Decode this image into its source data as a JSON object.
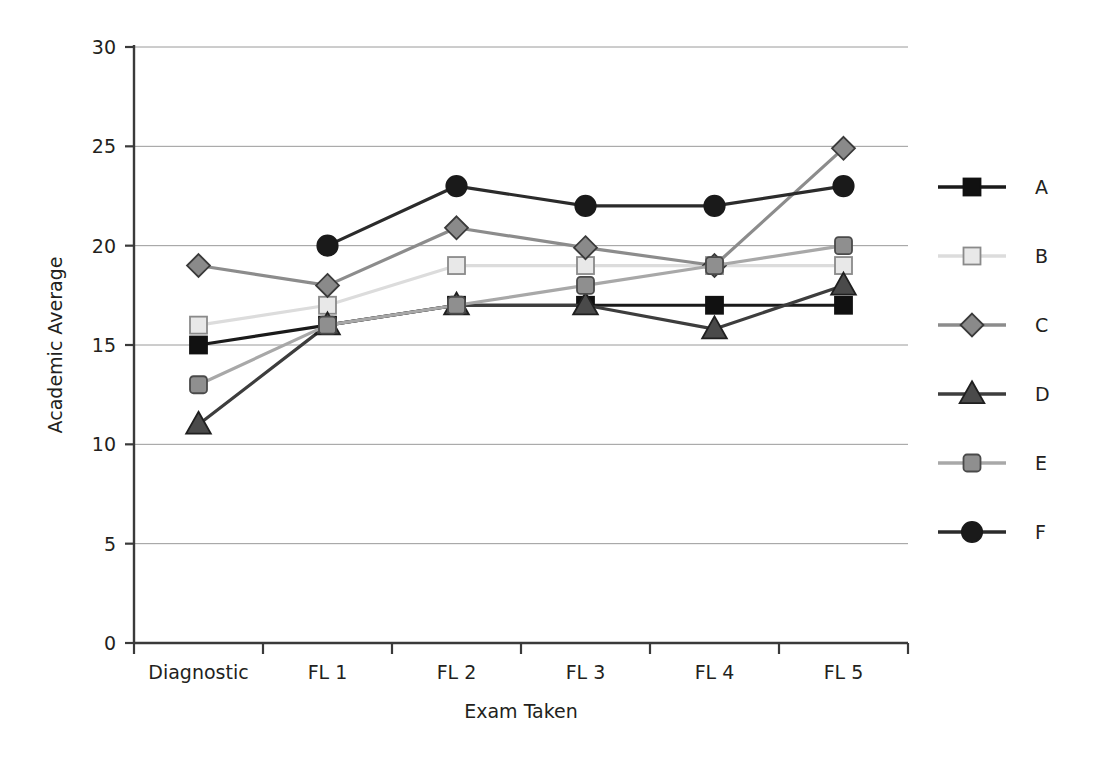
{
  "chart_data": {
    "type": "line",
    "title": "",
    "xlabel": "Exam Taken",
    "ylabel": "Academic Average",
    "categories": [
      "Diagnostic",
      "FL 1",
      "FL 2",
      "FL 3",
      "FL 4",
      "FL 5"
    ],
    "ylim": [
      0,
      30
    ],
    "yticks": [
      0,
      5,
      10,
      15,
      20,
      25,
      30
    ],
    "ytick_labels": [
      "0",
      "5",
      "10",
      "15",
      "20",
      "25",
      "30"
    ],
    "grid": "horizontal",
    "legend_position": "right",
    "series": [
      {
        "name": "A",
        "values": [
          15,
          16,
          17,
          17,
          17,
          17
        ],
        "marker": "square-filled",
        "line_color": "#1a1a1a",
        "marker_fill": "#111111",
        "marker_stroke": "#111111"
      },
      {
        "name": "B",
        "values": [
          16,
          17,
          19,
          19,
          19,
          19
        ],
        "marker": "square-open",
        "line_color": "#dcdcdc",
        "marker_fill": "#e8e8e8",
        "marker_stroke": "#8a8a8a"
      },
      {
        "name": "C",
        "values": [
          19,
          18,
          20.9,
          19.9,
          19,
          24.9
        ],
        "marker": "diamond",
        "line_color": "#8c8c8c",
        "marker_fill": "#8a8a8a",
        "marker_stroke": "#3a3a3a"
      },
      {
        "name": "D",
        "values": [
          11,
          16,
          17,
          17,
          15.8,
          18
        ],
        "marker": "triangle",
        "line_color": "#3d3d3d",
        "marker_fill": "#4a4a4a",
        "marker_stroke": "#1f1f1f"
      },
      {
        "name": "E",
        "values": [
          13,
          16,
          17,
          18,
          19,
          20
        ],
        "marker": "square-rounded",
        "line_color": "#a8a8a8",
        "marker_fill": "#8f8f8f",
        "marker_stroke": "#4a4a4a"
      },
      {
        "name": "F",
        "values": [
          null,
          20,
          23,
          22,
          22,
          23
        ],
        "marker": "circle",
        "line_color": "#2b2b2b",
        "marker_fill": "#1a1a1a",
        "marker_stroke": "#1a1a1a"
      }
    ],
    "legend_entries": [
      {
        "label": "A"
      },
      {
        "label": "B"
      },
      {
        "label": "C"
      },
      {
        "label": "D"
      },
      {
        "label": "E"
      },
      {
        "label": "F"
      }
    ],
    "colors": {
      "axis": "#3a3a3a",
      "gridline": "#9a9a9a",
      "background": "#ffffff",
      "text": "#231f20"
    }
  }
}
